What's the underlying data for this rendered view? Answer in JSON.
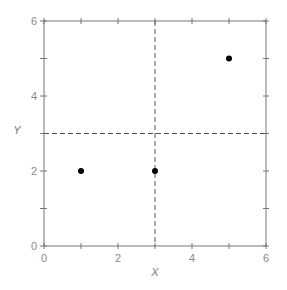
{
  "chart_data": {
    "type": "scatter",
    "title": "",
    "xlabel": "X",
    "ylabel": "Y",
    "xlim": [
      0,
      6
    ],
    "ylim": [
      0,
      6
    ],
    "grid": false,
    "legend": null,
    "x_ticks": [
      0,
      2,
      4,
      6
    ],
    "y_ticks": [
      0,
      2,
      4,
      6
    ],
    "minor_ticks_every": 1,
    "series": [
      {
        "name": "points",
        "x": [
          1,
          3,
          5
        ],
        "y": [
          2,
          2,
          5
        ],
        "marker": "filled-circle",
        "color": "#000000"
      }
    ],
    "reference_lines": [
      {
        "orientation": "vertical",
        "value": 3,
        "style": "dashed",
        "color": "#555555"
      },
      {
        "orientation": "horizontal",
        "value": 3,
        "style": "dashed",
        "color": "#555555"
      }
    ]
  },
  "colors": {
    "axis": "#777777",
    "tick_text": "#8a8a8a",
    "marker": "#000000",
    "reference_line": "#555555"
  }
}
